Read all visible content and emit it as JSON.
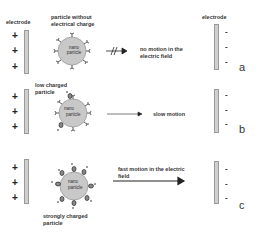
{
  "header": {
    "left_electrode_label": "electrode",
    "right_electrode_label": "electrode"
  },
  "electrodes": {
    "left_sign": "+",
    "right_sign": "-"
  },
  "rows": [
    {
      "letter": "a",
      "particle_label": "particle without electrical charge",
      "particle_text_1": "nano",
      "particle_text_2": "particle",
      "motion_label": "no motion in the electric field",
      "arrow_type": "blocked-arrow"
    },
    {
      "letter": "b",
      "particle_label": "low charged particle",
      "particle_text_1": "nano",
      "particle_text_2": "particle",
      "motion_label": "slow motion",
      "arrow_type": "thin-arrow"
    },
    {
      "letter": "c",
      "particle_label": "strongly charged particle",
      "particle_text_1": "nano",
      "particle_text_2": "particle",
      "motion_label": "fast motion in the electric field",
      "arrow_type": "thick-arrow"
    }
  ],
  "colors": {
    "particle_fill": "#c8c8c8",
    "electrode_fill": "#cfcfcf",
    "ink": "#222222"
  }
}
